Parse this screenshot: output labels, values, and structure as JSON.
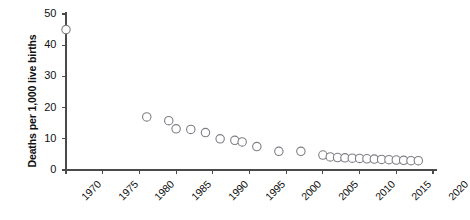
{
  "chart_data": {
    "type": "scatter",
    "title": "",
    "subtitle": "",
    "xlabel": "",
    "ylabel": "Deaths per 1,000 live births",
    "xlim": [
      1970,
      2020
    ],
    "ylim": [
      0,
      50
    ],
    "xticks": [
      1970,
      1975,
      1980,
      1985,
      1990,
      1995,
      2000,
      2005,
      2010,
      2015,
      2020
    ],
    "yticks": [
      0,
      10,
      20,
      30,
      40,
      50
    ],
    "grid": false,
    "legend": null,
    "marker": {
      "shape": "circle",
      "filled": false,
      "edge_color": "#7d7d85",
      "face_color": "#ffffff",
      "radius_px": 4.2,
      "edge_width_px": 1.1
    },
    "axis_color": "#4a4a4a",
    "series": [
      {
        "name": "Infant mortality rate",
        "points": [
          {
            "x": 1970,
            "y": 45.0
          },
          {
            "x": 1981,
            "y": 17.0
          },
          {
            "x": 1984,
            "y": 15.8
          },
          {
            "x": 1985,
            "y": 13.2
          },
          {
            "x": 1987,
            "y": 13.0
          },
          {
            "x": 1989,
            "y": 12.0
          },
          {
            "x": 1991,
            "y": 10.0
          },
          {
            "x": 1993,
            "y": 9.5
          },
          {
            "x": 1994,
            "y": 9.0
          },
          {
            "x": 1996,
            "y": 7.5
          },
          {
            "x": 1999,
            "y": 6.0
          },
          {
            "x": 2002,
            "y": 6.0
          },
          {
            "x": 2005,
            "y": 4.8
          },
          {
            "x": 2006,
            "y": 4.2
          },
          {
            "x": 2007,
            "y": 4.0
          },
          {
            "x": 2008,
            "y": 3.9
          },
          {
            "x": 2009,
            "y": 3.8
          },
          {
            "x": 2010,
            "y": 3.7
          },
          {
            "x": 2011,
            "y": 3.6
          },
          {
            "x": 2012,
            "y": 3.5
          },
          {
            "x": 2013,
            "y": 3.4
          },
          {
            "x": 2014,
            "y": 3.3
          },
          {
            "x": 2015,
            "y": 3.2
          },
          {
            "x": 2016,
            "y": 3.1
          },
          {
            "x": 2017,
            "y": 3.0
          },
          {
            "x": 2018,
            "y": 3.0
          }
        ]
      }
    ]
  }
}
